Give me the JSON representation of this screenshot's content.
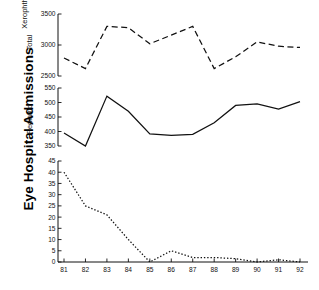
{
  "figure": {
    "axis_title": "Eye Hospital Admissions",
    "background": "#ffffff",
    "ink": "#111111"
  },
  "chart_data": {
    "type": "line",
    "title": "",
    "subtitle": "",
    "xlabel": "",
    "ylabel": "Eye Hospital Admissions",
    "grid": false,
    "legend": "none",
    "x": [
      "81",
      "82",
      "83",
      "84",
      "85",
      "86",
      "87",
      "88",
      "89",
      "90",
      "91",
      "92"
    ],
    "xtick_labels": [
      "81",
      "82",
      "83",
      "84",
      "85",
      "86",
      "87",
      "88",
      "89",
      "90",
      "91",
      "92"
    ],
    "panels": [
      {
        "name": "total",
        "label": "Total",
        "linestyle": "dashed",
        "color": "#111111",
        "ylim": [
          2500,
          3500
        ],
        "yticks": [
          2500,
          3000,
          3500
        ],
        "ytick_labels": [
          "2500",
          "3000",
          "3500"
        ],
        "values": [
          2790,
          2620,
          3300,
          3280,
          3020,
          3160,
          3300,
          2620,
          2810,
          3050,
          2980,
          2960
        ]
      },
      {
        "name": "pediatric",
        "label": "Pediatric",
        "linestyle": "solid",
        "color": "#111111",
        "ylim": [
          350,
          550
        ],
        "yticks": [
          350,
          400,
          450,
          500,
          550
        ],
        "ytick_labels": [
          "350",
          "400",
          "450",
          "500",
          "550"
        ],
        "values": [
          395,
          350,
          522,
          470,
          392,
          387,
          390,
          430,
          490,
          495,
          477,
          503
        ]
      },
      {
        "name": "xerophthalmia",
        "label": "Xerophthalmia",
        "linestyle": "dotted",
        "color": "#111111",
        "ylim": [
          0,
          45
        ],
        "yticks": [
          0,
          5,
          10,
          15,
          20,
          25,
          30,
          35,
          40,
          45
        ],
        "ytick_labels": [
          "0",
          "5",
          "10",
          "15",
          "20",
          "25",
          "30",
          "35",
          "40",
          "45"
        ],
        "values": [
          40,
          25,
          21,
          10,
          0,
          5,
          2,
          2,
          1.5,
          0,
          1,
          0
        ]
      }
    ]
  }
}
